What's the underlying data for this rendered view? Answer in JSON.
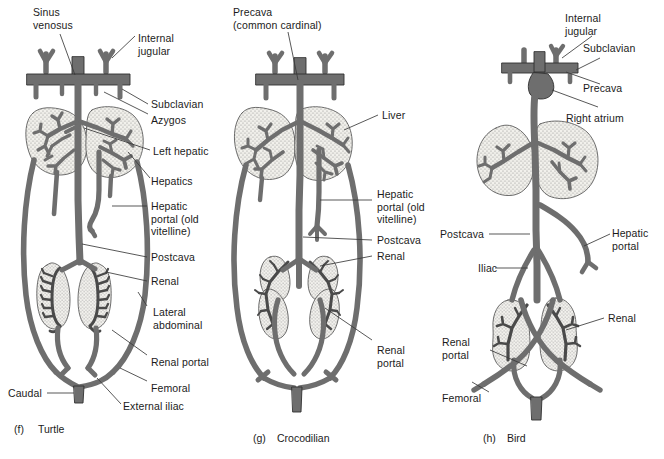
{
  "figure": {
    "background_color": "#ffffff",
    "vessel_color": "#6e6e6e",
    "vessel_outline_color": "#2b2b2b",
    "organ_fill_color": "#f0efea",
    "organ_stipple_color": "#8c8c8c",
    "label_color": "#1b1b1b",
    "leader_color": "#3a3a3a"
  },
  "panels": [
    {
      "id": "turtle",
      "caption_letter": "(f)",
      "caption_name": "Turtle",
      "labels": [
        {
          "key": "sinus_venosus",
          "text": "Sinus\nvenosus"
        },
        {
          "key": "internal_jugular",
          "text": "Internal\njugular"
        },
        {
          "key": "subclavian",
          "text": "Subclavian"
        },
        {
          "key": "azygos",
          "text": "Azygos"
        },
        {
          "key": "left_hepatic",
          "text": "Left hepatic"
        },
        {
          "key": "hepatics",
          "text": "Hepatics"
        },
        {
          "key": "hepatic_portal",
          "text": "Hepatic\nportal (old\nvitelline)"
        },
        {
          "key": "postcava",
          "text": "Postcava"
        },
        {
          "key": "renal",
          "text": "Renal"
        },
        {
          "key": "lateral_abdominal",
          "text": "Lateral\nabdominal"
        },
        {
          "key": "renal_portal",
          "text": "Renal portal"
        },
        {
          "key": "femoral",
          "text": "Femoral"
        },
        {
          "key": "external_iliac",
          "text": "External iliac"
        },
        {
          "key": "caudal",
          "text": "Caudal"
        }
      ]
    },
    {
      "id": "crocodilian",
      "caption_letter": "(g)",
      "caption_name": "Crocodilian",
      "labels": [
        {
          "key": "precava",
          "text": "Precava\n(common cardinal)"
        },
        {
          "key": "liver",
          "text": "Liver"
        },
        {
          "key": "hepatic_portal",
          "text": "Hepatic\nportal (old\nvitelline)"
        },
        {
          "key": "postcava",
          "text": "Postcava"
        },
        {
          "key": "renal",
          "text": "Renal"
        },
        {
          "key": "renal_portal",
          "text": "Renal\nportal"
        }
      ]
    },
    {
      "id": "bird",
      "caption_letter": "(h)",
      "caption_name": "Bird",
      "labels": [
        {
          "key": "internal_jugular",
          "text": "Internal\njugular"
        },
        {
          "key": "subclavian",
          "text": "Subclavian"
        },
        {
          "key": "precava",
          "text": "Precava"
        },
        {
          "key": "right_atrium",
          "text": "Right atrium"
        },
        {
          "key": "postcava",
          "text": "Postcava"
        },
        {
          "key": "hepatic_portal",
          "text": "Hepatic\nportal"
        },
        {
          "key": "iliac",
          "text": "Iliac"
        },
        {
          "key": "renal",
          "text": "Renal"
        },
        {
          "key": "renal_portal",
          "text": "Renal\nportal"
        },
        {
          "key": "femoral",
          "text": "Femoral"
        }
      ]
    }
  ]
}
